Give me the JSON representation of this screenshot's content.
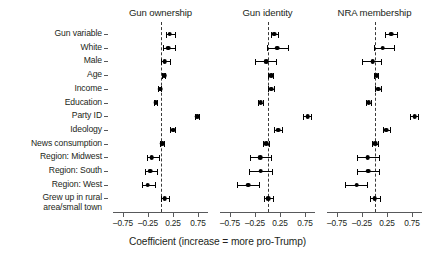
{
  "chart_data": {
    "type": "scatter",
    "title": "",
    "xlabel": "Coefficient (increase = more pro-Trump)",
    "ylabel": "",
    "xlim": [
      -1.05,
      1.05
    ],
    "xticks": [
      -0.75,
      -0.25,
      0.25,
      0.75
    ],
    "xticklabels": [
      "–0.75",
      "–0.25",
      "0.25",
      "0.75"
    ],
    "grid": false,
    "legend": null,
    "reference_line": 0,
    "reference_line_style": "dashed",
    "marker": "filled-circle",
    "errorbar": "95% confidence interval",
    "categories": [
      "Gun variable",
      "White",
      "Male",
      "Age",
      "Income",
      "Education",
      "Party ID",
      "Ideology",
      "News consumption",
      "Region: Midwest",
      "Region: South",
      "Region: West",
      "Grew up in rural\narea/small town"
    ],
    "panels": [
      {
        "title": "Gun ownership",
        "points": [
          {
            "category": "Gun variable",
            "estimate": 0.18,
            "low": 0.11,
            "high": 0.3
          },
          {
            "category": "White",
            "estimate": 0.15,
            "low": 0.04,
            "high": 0.31
          },
          {
            "category": "Male",
            "estimate": 0.08,
            "low": 0.0,
            "high": 0.2
          },
          {
            "category": "Age",
            "estimate": 0.07,
            "low": 0.03,
            "high": 0.11
          },
          {
            "category": "Income",
            "estimate": -0.01,
            "low": -0.05,
            "high": 0.03
          },
          {
            "category": "Education",
            "estimate": -0.1,
            "low": -0.14,
            "high": -0.06
          },
          {
            "category": "Party ID",
            "estimate": 0.73,
            "low": 0.68,
            "high": 0.78
          },
          {
            "category": "Ideology",
            "estimate": 0.25,
            "low": 0.19,
            "high": 0.31
          },
          {
            "category": "News consumption",
            "estimate": 0.03,
            "low": -0.02,
            "high": 0.08
          },
          {
            "category": "Region: Midwest",
            "estimate": -0.18,
            "low": -0.27,
            "high": -0.02
          },
          {
            "category": "Region: South",
            "estimate": -0.21,
            "low": -0.32,
            "high": -0.05
          },
          {
            "category": "Region: West",
            "estimate": -0.26,
            "low": -0.37,
            "high": -0.1
          },
          {
            "category": "Grew up in rural\narea/small town",
            "estimate": 0.08,
            "low": 0.0,
            "high": 0.18
          }
        ]
      },
      {
        "title": "Gun identity",
        "points": [
          {
            "category": "Gun variable",
            "estimate": 0.13,
            "low": 0.07,
            "high": 0.22
          },
          {
            "category": "White",
            "estimate": 0.19,
            "low": -0.02,
            "high": 0.42
          },
          {
            "category": "Male",
            "estimate": -0.03,
            "low": -0.26,
            "high": 0.18
          },
          {
            "category": "Age",
            "estimate": 0.07,
            "low": 0.01,
            "high": 0.13
          },
          {
            "category": "Income",
            "estimate": 0.07,
            "low": 0.0,
            "high": 0.14
          },
          {
            "category": "Education",
            "estimate": -0.14,
            "low": -0.2,
            "high": -0.08
          },
          {
            "category": "Party ID",
            "estimate": 0.8,
            "low": 0.71,
            "high": 0.89
          },
          {
            "category": "Ideology",
            "estimate": 0.21,
            "low": 0.13,
            "high": 0.3
          },
          {
            "category": "News consumption",
            "estimate": -0.03,
            "low": -0.1,
            "high": 0.05
          },
          {
            "category": "Region: Midwest",
            "estimate": -0.15,
            "low": -0.36,
            "high": 0.08
          },
          {
            "category": "Region: South",
            "estimate": -0.14,
            "low": -0.37,
            "high": 0.11
          },
          {
            "category": "Region: West",
            "estimate": -0.39,
            "low": -0.62,
            "high": -0.15
          },
          {
            "category": "Grew up in rural\narea/small town",
            "estimate": 0.01,
            "low": -0.08,
            "high": 0.13
          }
        ]
      },
      {
        "title": "NRA membership",
        "points": [
          {
            "category": "Gun variable",
            "estimate": 0.33,
            "low": 0.21,
            "high": 0.47
          },
          {
            "category": "White",
            "estimate": 0.16,
            "low": -0.01,
            "high": 0.41
          },
          {
            "category": "Male",
            "estimate": -0.04,
            "low": -0.26,
            "high": 0.14
          },
          {
            "category": "Age",
            "estimate": 0.04,
            "low": -0.02,
            "high": 0.09
          },
          {
            "category": "Income",
            "estimate": 0.07,
            "low": 0.0,
            "high": 0.14
          },
          {
            "category": "Education",
            "estimate": -0.12,
            "low": -0.18,
            "high": -0.06
          },
          {
            "category": "Party ID",
            "estimate": 0.8,
            "low": 0.71,
            "high": 0.89
          },
          {
            "category": "Ideology",
            "estimate": 0.23,
            "low": 0.16,
            "high": 0.32
          },
          {
            "category": "News consumption",
            "estimate": 0.01,
            "low": -0.06,
            "high": 0.09
          },
          {
            "category": "Region: Midwest",
            "estimate": -0.14,
            "low": -0.35,
            "high": 0.1
          },
          {
            "category": "Region: South",
            "estimate": -0.13,
            "low": -0.36,
            "high": 0.11
          },
          {
            "category": "Region: West",
            "estimate": -0.36,
            "low": -0.6,
            "high": -0.14
          },
          {
            "category": "Grew up in rural\narea/small town",
            "estimate": 0.0,
            "low": -0.1,
            "high": 0.12
          }
        ]
      }
    ]
  }
}
